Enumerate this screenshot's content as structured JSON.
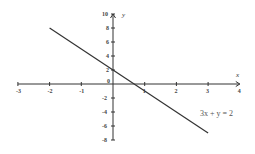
{
  "chart_data": {
    "type": "line",
    "title": "",
    "xlabel": "x",
    "ylabel": "y",
    "xlim": [
      -3,
      4
    ],
    "ylim": [
      -8,
      10
    ],
    "grid": false,
    "x_ticks": [
      -3,
      -2,
      -1,
      0,
      1,
      2,
      3,
      4
    ],
    "y_ticks": [
      10,
      8,
      6,
      4,
      2,
      0,
      -2,
      -4,
      -6,
      -8
    ],
    "series": [
      {
        "name": "3x + y = 2",
        "equation": "3x + y = 2",
        "x": [
          -2,
          3
        ],
        "y": [
          8,
          -7
        ]
      }
    ],
    "annotations": [
      {
        "text": "3x + y = 2",
        "x": 2.75,
        "y": -4.2
      }
    ],
    "colors": {
      "axis": "#333333",
      "line": "#333333",
      "text": "#444444"
    }
  },
  "labels": {
    "x_axis": "x",
    "y_axis": "y",
    "equation": "3x + y = 2",
    "x_tick_labels": [
      "-3",
      "-2",
      "-1",
      "0",
      "1",
      "2",
      "3",
      "4"
    ],
    "y_tick_labels": [
      "10",
      "8",
      "6",
      "4",
      "2",
      "-2",
      "-4",
      "-6",
      "-8"
    ]
  }
}
